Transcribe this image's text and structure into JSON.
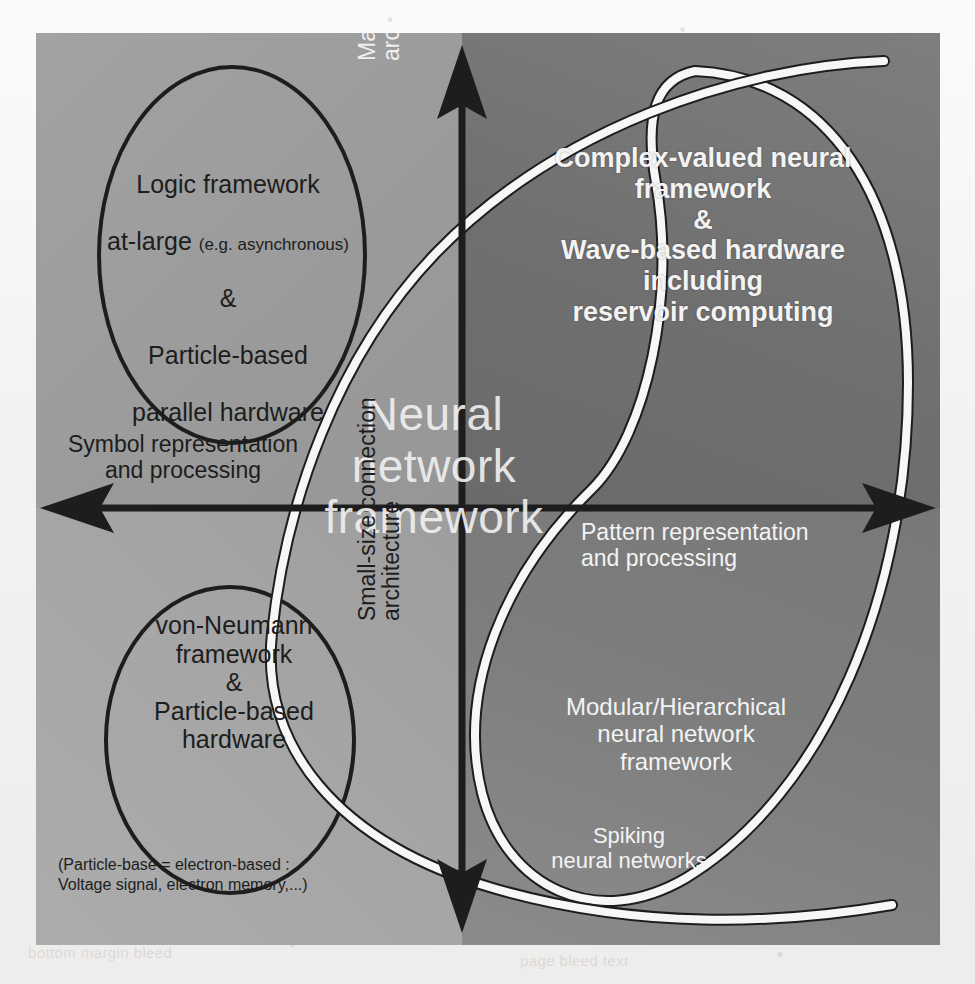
{
  "figure": {
    "center_label": "Neural\nnetwork\nframework"
  },
  "axes": {
    "horizontal_left_label": "Symbol representation\nand processing",
    "horizontal_right_label": "Pattern representation\nand processing",
    "vertical_top_label_line1": "Massive-connection",
    "vertical_top_label_line2": "architecture",
    "vertical_bottom_label_line1": "Small-size connection",
    "vertical_bottom_label_line2": "architecture"
  },
  "quadrants": {
    "top_left": {
      "line1": "Logic framework",
      "line2_main": "at-large ",
      "line2_small": "(e.g. asynchronous)",
      "line3": "&",
      "line4": "Particle-based",
      "line5": "parallel hardware"
    },
    "top_right": {
      "text": "Complex-valued neural\nframework\n&\nWave-based hardware\nincluding\nreservoir computing"
    },
    "bottom_left": {
      "text": "von-Neumann\nframework\n&\nParticle-based\nhardware"
    },
    "bottom_right": {
      "modular": "Modular/Hierarchical\nneural network\nframework",
      "spiking": "Spiking\nneural networks"
    }
  },
  "footnote": {
    "text": "(Particle-base = electron-based :\n  Voltage signal, electron memory,...)"
  },
  "colors": {
    "quadrant_top_left": "#9b9b9b",
    "quadrant_top_right": "#6f6f6f",
    "quadrant_bottom_left": "#a5a5a5",
    "quadrant_bottom_right": "#7d7d7d",
    "axis_dark": "#1d1d1d",
    "highlight_curve": "#f7f7f7",
    "ellipse_outline": "#1d1d1d"
  },
  "background_ghost_text": {
    "bottom_left": "bottom margin bleed",
    "bottom_right": "page bleed text",
    "mid_right": "scanned page ghost"
  }
}
